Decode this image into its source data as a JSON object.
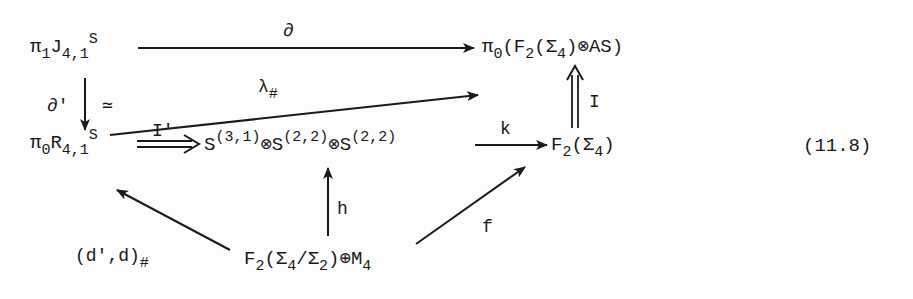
{
  "diagram": {
    "equation_number": "(11.8)",
    "nodes": {
      "pi1J": {
        "base": "π",
        "sub1": "1",
        "mid": "J",
        "sub2": "4,1",
        "sup": "S"
      },
      "pi0F2AS": {
        "base": "π",
        "sub1": "0",
        "open": "(F",
        "sub2": "2",
        "mid": "(Σ",
        "sub3": "4",
        "close": ")⊗AS)"
      },
      "pi0R": {
        "base": "π",
        "sub1": "0",
        "mid": "R",
        "sub2": "4,1",
        "sup": "S"
      },
      "tensor": {
        "s1": "S",
        "sup1": "(3,1)",
        "t1": "⊗S",
        "sup2": "(2,2)",
        "t2": "⊗S",
        "sup3": "(2,2)"
      },
      "F2S4": {
        "base": "F",
        "sub1": "2",
        "mid": "(Σ",
        "sub2": "4",
        "close": ")"
      },
      "F2quot": {
        "base": "F",
        "sub1": "2",
        "mid": "(Σ",
        "sub2": "4",
        "slash": "/Σ",
        "sub3": "2",
        "close": ")⊕M",
        "sub4": "4"
      }
    },
    "arrows": [
      {
        "id": "partial",
        "label": "∂",
        "from": "pi1J",
        "to": "pi0F2AS",
        "style": "single"
      },
      {
        "id": "lambda",
        "label": "λ",
        "label_sub": "#",
        "from": "pi0R",
        "to": "pi0F2AS",
        "style": "single"
      },
      {
        "id": "partial-prime",
        "label": "∂'",
        "label2": "≃",
        "from": "pi1J",
        "to": "pi0R",
        "style": "single"
      },
      {
        "id": "I-prime",
        "label": "I'",
        "from": "pi0R",
        "to": "tensor",
        "style": "double"
      },
      {
        "id": "k",
        "label": "k",
        "from": "tensor",
        "to": "F2S4",
        "style": "single"
      },
      {
        "id": "I",
        "label": "I",
        "from": "F2S4",
        "to": "pi0F2AS",
        "style": "double"
      },
      {
        "id": "h",
        "label": "h",
        "from": "F2quot",
        "to": "tensor",
        "style": "single"
      },
      {
        "id": "dd",
        "label": "(d',d)",
        "label_sub": "#",
        "from": "F2quot",
        "to": "pi0R",
        "style": "single"
      },
      {
        "id": "f",
        "label": "f",
        "from": "F2quot",
        "to": "F2S4",
        "style": "single"
      }
    ]
  }
}
